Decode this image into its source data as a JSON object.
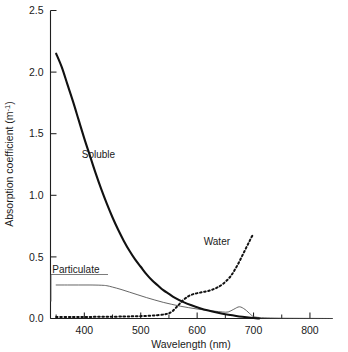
{
  "chart_data": {
    "type": "line",
    "title": "",
    "xlabel": "Wavelength (nm)",
    "ylabel": "Absorption coefficient (m⁻¹)",
    "xlim": [
      340,
      840
    ],
    "ylim": [
      0.0,
      2.5
    ],
    "grid": false,
    "legend_position": "inline-annotations",
    "xticks": [
      400,
      500,
      600,
      700,
      800
    ],
    "xtick_labels": [
      "400",
      "500",
      "600",
      "700",
      "800"
    ],
    "xticks_minor": [
      350,
      450,
      550,
      650,
      750
    ],
    "yticks": [
      0.0,
      0.5,
      1.0,
      1.5,
      2.0,
      2.5
    ],
    "ytick_labels": [
      "0.0",
      "0.5",
      "1.0",
      "1.5",
      "2.0",
      "2.5"
    ],
    "annotations": [
      {
        "text": "Soluble",
        "x": 425,
        "y": 1.3
      },
      {
        "text": "Water",
        "x": 635,
        "y": 0.6
      },
      {
        "text": "Particulate",
        "x": 385,
        "y": 0.37
      }
    ],
    "series": [
      {
        "name": "Soluble",
        "style": "solid-thick",
        "color": "#111111",
        "x": [
          350,
          360,
          370,
          380,
          390,
          400,
          410,
          420,
          430,
          440,
          450,
          460,
          470,
          480,
          490,
          500,
          510,
          520,
          530,
          540,
          550,
          560,
          575,
          590,
          605,
          620,
          635,
          650,
          665,
          680,
          695,
          710
        ],
        "y": [
          2.15,
          2.04,
          1.9,
          1.76,
          1.61,
          1.46,
          1.32,
          1.18,
          1.05,
          0.93,
          0.82,
          0.72,
          0.63,
          0.55,
          0.48,
          0.42,
          0.36,
          0.31,
          0.27,
          0.23,
          0.2,
          0.17,
          0.135,
          0.107,
          0.084,
          0.065,
          0.049,
          0.035,
          0.024,
          0.014,
          0.006,
          0.0
        ]
      },
      {
        "name": "Particulate",
        "style": "solid-thin",
        "color": "#4a4a4a",
        "x": [
          350,
          370,
          390,
          410,
          430,
          440,
          450,
          465,
          480,
          495,
          510,
          525,
          540,
          555,
          570,
          585,
          600,
          615,
          630,
          645,
          655,
          665,
          675,
          685,
          695,
          700,
          710,
          730,
          760,
          800,
          840
        ],
        "y": [
          0.272,
          0.272,
          0.272,
          0.272,
          0.27,
          0.266,
          0.255,
          0.236,
          0.214,
          0.192,
          0.17,
          0.15,
          0.131,
          0.115,
          0.1,
          0.088,
          0.077,
          0.068,
          0.06,
          0.053,
          0.053,
          0.075,
          0.095,
          0.073,
          0.032,
          0.016,
          0.008,
          0.004,
          0.002,
          0.001,
          0.0
        ]
      },
      {
        "name": "Water",
        "style": "dotted-thick",
        "color": "#111111",
        "x": [
          350,
          380,
          410,
          440,
          470,
          490,
          510,
          530,
          545,
          555,
          565,
          575,
          585,
          595,
          605,
          615,
          625,
          635,
          645,
          655,
          662,
          668,
          674,
          680,
          686,
          692,
          697,
          700
        ],
        "y": [
          0.012,
          0.012,
          0.013,
          0.014,
          0.016,
          0.018,
          0.021,
          0.027,
          0.036,
          0.055,
          0.1,
          0.148,
          0.182,
          0.2,
          0.21,
          0.219,
          0.231,
          0.25,
          0.278,
          0.32,
          0.36,
          0.405,
          0.455,
          0.51,
          0.565,
          0.62,
          0.665,
          0.682
        ]
      }
    ]
  },
  "figure": {
    "background_color": "#ffffff",
    "axis_color": "#1f1f1f"
  }
}
